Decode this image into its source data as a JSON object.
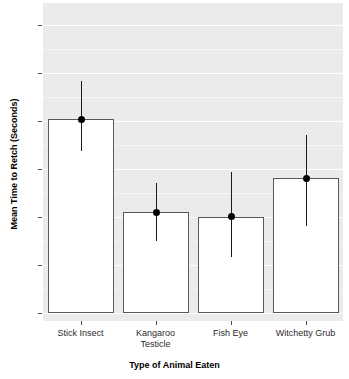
{
  "chart_data": {
    "type": "bar",
    "title": "",
    "subtitle": "",
    "xlabel": "Type of Animal Eaten",
    "ylabel": "Mean Time to Retch (Seconds)",
    "categories": [
      "Stick Insect",
      "Kangaroo Testicle",
      "Fish Eye",
      "Witchetty Grub"
    ],
    "category_lines": [
      [
        "Stick Insect"
      ],
      [
        "Kangaroo",
        "Testicle"
      ],
      [
        "Fish Eye"
      ],
      [
        "Witchetty Grub"
      ]
    ],
    "values": [
      8.05,
      4.18,
      4.0,
      5.6
    ],
    "error_low": [
      6.75,
      3.0,
      2.3,
      3.6
    ],
    "error_high": [
      9.65,
      5.4,
      5.85,
      7.4
    ],
    "ylim": [
      -0.35,
      12.9
    ],
    "yticks": [
      0,
      2,
      4,
      6,
      8,
      10,
      12
    ],
    "ytick_labels": [
      "0",
      "2",
      "4",
      "6",
      "8",
      "10",
      "12"
    ],
    "minor_gridlines": [
      1,
      3,
      5,
      7,
      9,
      11
    ],
    "grid": true,
    "legend": "none",
    "legend_position": "none",
    "bar_fill": "#ffffff",
    "bar_border": "#595959",
    "point_color": "#000000",
    "error_color": "#1a1a1a",
    "panel_background": "#ebebeb",
    "gridline_color": "#ffffff"
  }
}
